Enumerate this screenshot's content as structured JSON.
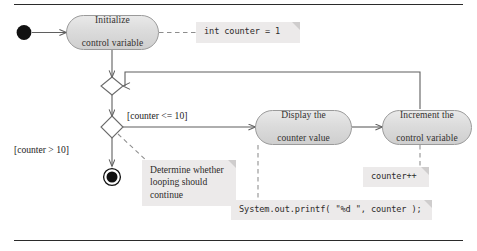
{
  "diagram": {
    "type": "uml-activity-diagram",
    "colors": {
      "node_fill_top": "#e9e9e9",
      "node_fill_bottom": "#cfcfcf",
      "node_border": "#9a9a9a",
      "note_fill": "#eceaea",
      "note_fold": "#cfcdcd",
      "connector": "#5f5f5f",
      "text": "#33312f",
      "rule": "#2b2b2b",
      "page_background": "#ffffff"
    }
  },
  "nodes": {
    "initial": {
      "name": "initial-node",
      "shape": "filled-circle"
    },
    "final": {
      "name": "final-node",
      "shape": "bullseye"
    },
    "merge": {
      "name": "merge-diamond",
      "shape": "diamond"
    },
    "decision": {
      "name": "decision-diamond",
      "shape": "diamond"
    },
    "initialize": {
      "line1": "Initialize",
      "line2": "control variable"
    },
    "display": {
      "line1": "Display the",
      "line2": "counter value"
    },
    "increment": {
      "line1": "Increment the",
      "line2": "control variable"
    }
  },
  "guards": {
    "loop_continue": "[counter <= 10]",
    "loop_exit": "[counter > 10]"
  },
  "notes": {
    "init_code": "int counter = 1",
    "decision_prose_line1": "Determine whether",
    "decision_prose_line2": "looping should",
    "decision_prose_line3": "continue",
    "printf_code": "System.out.printf( \"%d  \", counter );",
    "increment_code": "counter++"
  }
}
